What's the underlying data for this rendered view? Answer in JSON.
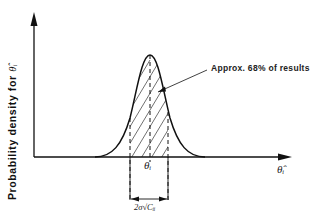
{
  "diagram": {
    "type": "normal-distribution-figure",
    "y_axis_label": "Probability  density  for",
    "y_axis_symbol": "θ̂ᵢ",
    "x_axis_symbol": "θ̂ᵢ",
    "center_label": "θᵢ",
    "annotation": "Approx.  68%  of results",
    "width_label": "2σ√Cᵢᵢ",
    "colors": {
      "line": "#111111",
      "background": "#ffffff"
    },
    "shaded_fraction_percent": 68
  }
}
